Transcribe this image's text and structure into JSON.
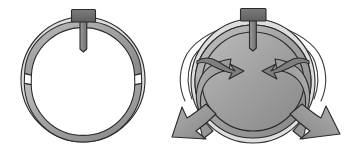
{
  "figure": {
    "title": "Split ring device: closed state and expanded state with flow arrows",
    "canvas": {
      "width": 361,
      "height": 146,
      "background": "#ffffff"
    },
    "palette": {
      "ring_body": "#9d9d9d",
      "ring_body_light": "#b4b4b4",
      "ring_body_dark": "#8a8a8a",
      "highlight": "#d8d8d8",
      "tab_fill": "#6f6f6f",
      "post_fill": "#808080",
      "arrow_fill": "#8f8f8f",
      "arrow_fill_dark": "#7a7a7a",
      "outline": "#2b2b2b",
      "background": "#ffffff"
    },
    "panels": [
      {
        "id": "panel-closed",
        "label": "Closed split ring",
        "center": {
          "x": 83,
          "y": 80
        },
        "outer_radius": 61,
        "inner_radius": 48,
        "gaps": [
          {
            "name": "left-gap",
            "angle_deg": 183,
            "span_deg": 9
          },
          {
            "name": "right-gap",
            "angle_deg": 357,
            "span_deg": 9
          }
        ],
        "tab": {
          "name": "mounting-tab",
          "x": 72,
          "y": 10,
          "width": 24,
          "height": 13
        },
        "post": {
          "name": "center-post",
          "x": 80,
          "y": 21,
          "width": 7,
          "height": 28
        }
      },
      {
        "id": "panel-expanded",
        "label": "Expanded split ring with deployment arrows",
        "center": {
          "x": 253,
          "y": 80
        },
        "outer_radius": 61,
        "inner_radius": 48,
        "tab": {
          "name": "mounting-tab",
          "x": 241,
          "y": 9,
          "width": 26,
          "height": 13
        },
        "post": {
          "name": "center-post",
          "x": 249,
          "y": 20,
          "width": 7,
          "height": 28
        },
        "arrows": [
          {
            "name": "outer-arrow-left",
            "direction": "down-left",
            "tip": {
              "x": 172,
              "y": 136
            }
          },
          {
            "name": "outer-arrow-right",
            "direction": "down-right",
            "tip": {
              "x": 340,
              "y": 134
            }
          },
          {
            "name": "inner-arrow-left",
            "direction": "inward-left",
            "tip": {
              "x": 233,
              "y": 70
            }
          },
          {
            "name": "inner-arrow-right",
            "direction": "inward-right",
            "tip": {
              "x": 276,
              "y": 70
            }
          }
        ],
        "guide_curves": [
          {
            "name": "guide-curve-left",
            "side": "left"
          },
          {
            "name": "guide-curve-right",
            "side": "right"
          }
        ]
      }
    ]
  }
}
